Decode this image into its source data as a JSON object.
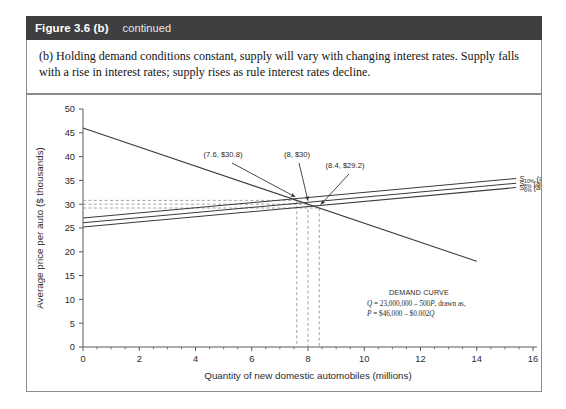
{
  "figure": {
    "number_label": "Figure 3.6 (b)",
    "continued_label": "continued",
    "caption": "(b) Holding demand conditions constant, supply will vary with changing interest rates. Supply falls with a rise in interest rates; supply rises as rule interest rates decline."
  },
  "chart_data": {
    "type": "line",
    "title": "",
    "xlabel": "Quantity of new domestic automobiles (millions)",
    "ylabel": "Average price per auto ($ thousands)",
    "xlim": [
      0,
      16
    ],
    "ylim": [
      0,
      50
    ],
    "xticks": [
      0,
      2,
      4,
      6,
      8,
      10,
      12,
      14,
      16
    ],
    "xtick_labels": [
      "0",
      "2",
      "4",
      "6",
      "8",
      "10",
      "12",
      "14",
      "16"
    ],
    "xminor_step": 0.5,
    "yticks": [
      0,
      5,
      10,
      15,
      20,
      25,
      30,
      35,
      40,
      45,
      50
    ],
    "ytick_labels": [
      "0",
      "5",
      "10",
      "15",
      "20",
      "25",
      "30",
      "35",
      "40",
      "45",
      "50"
    ],
    "grid": false,
    "legend_position": "right-inline",
    "series": [
      {
        "name": "Demand curve",
        "kind": "demand",
        "points": [
          [
            0,
            46
          ],
          [
            14,
            18
          ]
        ],
        "style": "solid"
      },
      {
        "name": "S10% (at 10 percent interest)",
        "symbol": "S",
        "subscript": "10%",
        "label_suffix": "(at 10 percent interest)",
        "kind": "supply",
        "points": [
          [
            0,
            27.1
          ],
          [
            15.4,
            35.4
          ]
        ],
        "style": "solid"
      },
      {
        "name": "S8% (at 8 percent interest)",
        "symbol": "S",
        "subscript": "8%",
        "label_suffix": "(at 8 percent interest)",
        "kind": "supply",
        "points": [
          [
            0,
            26.1
          ],
          [
            15.4,
            34.4
          ]
        ],
        "style": "solid"
      },
      {
        "name": "S6% (at 6 percent interest)",
        "symbol": "S",
        "subscript": "6%",
        "label_suffix": "(at 6 percent interest)",
        "kind": "supply",
        "points": [
          [
            0,
            25.2
          ],
          [
            15.4,
            33.5
          ]
        ],
        "style": "solid"
      }
    ],
    "equilibria": [
      {
        "label": "(7.6, $30.8)",
        "x": 7.6,
        "y": 30.8
      },
      {
        "label": "(8, $30)",
        "x": 8.0,
        "y": 30.0
      },
      {
        "label": "(8.4, $29.2)",
        "x": 8.4,
        "y": 29.2
      }
    ],
    "guide_lines": {
      "style": "dashed",
      "horizontal_values": [
        30.8,
        30.0,
        29.2
      ],
      "vertical_values": [
        7.6,
        8.0,
        8.4
      ]
    },
    "annotations": {
      "demand_curve_title": "DEMAND CURVE",
      "demand_curve_eq_line1_pre": "Q",
      "demand_curve_eq_line1": " = 23,000,000 – 500",
      "demand_curve_eq_line1_var": "P",
      "demand_curve_eq_line1_post": ", drawn as,",
      "demand_curve_eq_line2_pre": "P",
      "demand_curve_eq_line2": " = $46,000 – $0.002",
      "demand_curve_eq_line2_post": "Q"
    }
  },
  "colors": {
    "header_bg": "#3f3f41",
    "header_text": "#ffffff",
    "border": "#8b8b8b",
    "axis": "#5a5a5a",
    "curve": "#3a3a3a",
    "guide": "#9a9a9a",
    "page_bg": "#ffffff"
  }
}
